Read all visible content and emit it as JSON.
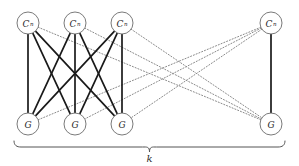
{
  "figure": {
    "caption_label": "k"
  },
  "colors": {
    "node_stroke": "#6b6b6b",
    "node_fill": "#ffffff",
    "solid_edge": "#1a1a1a",
    "dotted_edge": "#8a8a8a",
    "brace": "#555555",
    "text": "#2a2a2a",
    "background": "#ffffff"
  },
  "nodes": {
    "top": [
      {
        "id": "top-0",
        "label": "C",
        "subscript": "n",
        "cx": 28,
        "cy": 23,
        "r": 11
      },
      {
        "id": "top-1",
        "label": "C",
        "subscript": "n",
        "cx": 75,
        "cy": 23,
        "r": 11
      },
      {
        "id": "top-2",
        "label": "C",
        "subscript": "n",
        "cx": 122,
        "cy": 23,
        "r": 11
      },
      {
        "id": "top-3",
        "label": "C",
        "subscript": "n",
        "cx": 271,
        "cy": 23,
        "r": 11
      }
    ],
    "bottom": [
      {
        "id": "bottom-0",
        "label": "G",
        "subscript": "",
        "cx": 28,
        "cy": 124,
        "r": 11
      },
      {
        "id": "bottom-1",
        "label": "G",
        "subscript": "",
        "cx": 75,
        "cy": 124,
        "r": 11
      },
      {
        "id": "bottom-2",
        "label": "G",
        "subscript": "",
        "cx": 122,
        "cy": 124,
        "r": 11
      },
      {
        "id": "bottom-3",
        "label": "G",
        "subscript": "",
        "cx": 271,
        "cy": 124,
        "r": 11
      }
    ]
  },
  "edges": {
    "solid": [
      {
        "from": "top-0",
        "to": "bottom-0"
      },
      {
        "from": "top-0",
        "to": "bottom-1"
      },
      {
        "from": "top-0",
        "to": "bottom-2"
      },
      {
        "from": "top-1",
        "to": "bottom-0"
      },
      {
        "from": "top-1",
        "to": "bottom-1"
      },
      {
        "from": "top-1",
        "to": "bottom-2"
      },
      {
        "from": "top-2",
        "to": "bottom-0"
      },
      {
        "from": "top-2",
        "to": "bottom-1"
      },
      {
        "from": "top-2",
        "to": "bottom-2"
      },
      {
        "from": "top-3",
        "to": "bottom-3"
      }
    ],
    "dotted": [
      {
        "from": "top-0",
        "to": "bottom-3"
      },
      {
        "from": "top-1",
        "to": "bottom-3"
      },
      {
        "from": "top-2",
        "to": "bottom-3"
      },
      {
        "from": "top-3",
        "to": "bottom-0"
      },
      {
        "from": "top-3",
        "to": "bottom-1"
      },
      {
        "from": "top-3",
        "to": "bottom-2"
      }
    ]
  },
  "brace": {
    "left_x": 14,
    "right_x": 285,
    "top_y": 141,
    "tip_x": 149.5,
    "label_x": 149.5,
    "label_y": 162
  }
}
